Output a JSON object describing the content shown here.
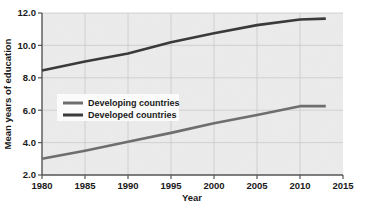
{
  "chart_data": {
    "type": "line",
    "title": "",
    "xlabel": "Year",
    "ylabel": "Mean years of education",
    "xlim": [
      1980,
      2015
    ],
    "ylim": [
      2.0,
      12.0
    ],
    "xticks": [
      1980,
      1985,
      1990,
      1995,
      2000,
      2005,
      2010,
      2015
    ],
    "xtick_labels": [
      "1980",
      "1985",
      "1990",
      "1995",
      "2000",
      "2005",
      "2010",
      "2015"
    ],
    "yticks": [
      2.0,
      4.0,
      6.0,
      8.0,
      10.0,
      12.0
    ],
    "ytick_labels": [
      "2.0",
      "4.0",
      "6.0",
      "8.0",
      "10.0",
      "12.0"
    ],
    "grid": true,
    "legend_position": "center-left",
    "plot_background": "#ececec",
    "series": [
      {
        "name": "Developing countries",
        "color": "#6e6e6e",
        "x": [
          1980,
          1985,
          1990,
          1995,
          2000,
          2005,
          2010,
          2013
        ],
        "values": [
          3.0,
          3.5,
          4.05,
          4.6,
          5.2,
          5.7,
          6.25,
          6.25
        ]
      },
      {
        "name": "Developed countries",
        "color": "#3a3a3a",
        "x": [
          1980,
          1985,
          1990,
          1995,
          2000,
          2005,
          2010,
          2013
        ],
        "values": [
          8.45,
          9.0,
          9.5,
          10.2,
          10.75,
          11.25,
          11.6,
          11.65
        ]
      }
    ],
    "legend_entries": [
      {
        "label": "Developing countries",
        "color": "#6e6e6e"
      },
      {
        "label": "Developed countries",
        "color": "#3a3a3a"
      }
    ]
  }
}
